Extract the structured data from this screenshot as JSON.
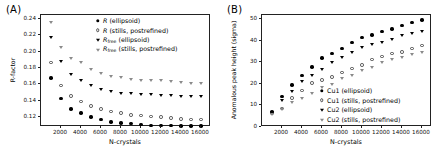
{
  "figure": {
    "panels": [
      {
        "label": "(A)",
        "axes": {
          "xlabel": "N-crystals",
          "ylabel": "R-factor",
          "xticks": [
            2000,
            4000,
            6000,
            8000,
            10000,
            12000,
            14000,
            16000
          ],
          "xticklabels": [
            "2000",
            "4000",
            "6000",
            "8000",
            "10000",
            "12000",
            "14000",
            "16000"
          ],
          "yticks": [
            0.12,
            0.14,
            0.16,
            0.18,
            0.2,
            0.22,
            0.24
          ],
          "yticklabels": [
            "0.12",
            "0.14",
            "0.16",
            "0.18",
            "0.20",
            "0.22",
            "0.24"
          ],
          "xlim": [
            0,
            17000
          ],
          "ylim": [
            0.108,
            0.245
          ]
        },
        "legend": [
          {
            "marker": "filled-circle",
            "label": "R (ellipsoid)"
          },
          {
            "marker": "open-circle",
            "label": "R (stills, postrefined)"
          },
          {
            "marker": "filled-triangle",
            "label": "Rfree (ellipsoid)"
          },
          {
            "marker": "open-triangle",
            "label": "Rfree (stills, postrefined)"
          }
        ]
      },
      {
        "label": "(B)",
        "axes": {
          "xlabel": "N-crystals",
          "ylabel": "Anomalous peak height (sigma)",
          "xticks": [
            2000,
            4000,
            6000,
            8000,
            10000,
            12000,
            14000,
            16000
          ],
          "xticklabels": [
            "2000",
            "4000",
            "6000",
            "8000",
            "10000",
            "12000",
            "14000",
            "16000"
          ],
          "yticks": [
            0,
            10,
            20,
            30,
            40,
            50
          ],
          "yticklabels": [
            "0",
            "10",
            "20",
            "30",
            "40",
            "50"
          ],
          "xlim": [
            0,
            17000
          ],
          "ylim": [
            0,
            52
          ]
        },
        "legend": [
          {
            "marker": "filled-circle",
            "label": "Cu1 (ellipsoid)"
          },
          {
            "marker": "open-circle",
            "label": "Cu1 (stills, postrefined)"
          },
          {
            "marker": "filled-triangle",
            "label": "Cu2 (ellipsoid)"
          },
          {
            "marker": "open-triangle",
            "label": "Cu2 (stills, postrefined)"
          }
        ]
      }
    ]
  },
  "chart_data": [
    {
      "type": "scatter",
      "panel": "(A)",
      "title": "",
      "xlabel": "N-crystals",
      "ylabel": "R-factor",
      "xlim": [
        0,
        17000
      ],
      "ylim": [
        0.108,
        0.245
      ],
      "grid": false,
      "legend_position": "upper right",
      "x": [
        1000,
        2000,
        3000,
        4000,
        5000,
        6000,
        7000,
        8000,
        9000,
        10000,
        11000,
        12000,
        13000,
        14000,
        15000,
        16000
      ],
      "series": [
        {
          "name": "R (ellipsoid)",
          "marker": "filled-circle",
          "values": [
            0.168,
            0.143,
            0.13,
            0.125,
            0.12,
            0.117,
            0.114,
            0.113,
            0.112,
            0.111,
            0.11,
            0.11,
            0.11,
            0.109,
            0.109,
            0.109
          ]
        },
        {
          "name": "R (stills, postrefined)",
          "marker": "open-circle",
          "values": [
            0.187,
            0.159,
            0.146,
            0.139,
            0.134,
            0.13,
            0.127,
            0.125,
            0.123,
            0.122,
            0.121,
            0.12,
            0.119,
            0.118,
            0.117,
            0.117
          ]
        },
        {
          "name": "Rfree (ellipsoid)",
          "marker": "filled-triangle",
          "values": [
            0.217,
            0.188,
            0.172,
            0.165,
            0.158,
            0.154,
            0.151,
            0.149,
            0.148,
            0.147,
            0.147,
            0.146,
            0.146,
            0.145,
            0.145,
            0.145
          ]
        },
        {
          "name": "Rfree (stills, postrefined)",
          "marker": "open-triangle",
          "values": [
            0.236,
            0.205,
            0.191,
            0.186,
            0.178,
            0.173,
            0.17,
            0.168,
            0.166,
            0.165,
            0.164,
            0.164,
            0.163,
            0.162,
            0.161,
            0.161
          ]
        }
      ]
    },
    {
      "type": "scatter",
      "panel": "(B)",
      "title": "",
      "xlabel": "N-crystals",
      "ylabel": "Anomalous peak height (sigma)",
      "xlim": [
        0,
        17000
      ],
      "ylim": [
        0,
        52
      ],
      "grid": false,
      "legend_position": "lower right",
      "x": [
        1000,
        2000,
        3000,
        4000,
        5000,
        6000,
        7000,
        8000,
        9000,
        10000,
        11000,
        12000,
        13000,
        14000,
        15000,
        16000
      ],
      "series": [
        {
          "name": "Cu1 (ellipsoid)",
          "marker": "filled-circle",
          "values": [
            7.0,
            14.3,
            19.5,
            23.9,
            27.8,
            32.0,
            34.1,
            36.4,
            39.3,
            41.6,
            42.7,
            44.2,
            45.5,
            47.2,
            48.5,
            49.6
          ]
        },
        {
          "name": "Cu1 (stills, postrefined)",
          "marker": "open-circle",
          "values": [
            6.3,
            8.6,
            13.6,
            17.0,
            20.4,
            21.8,
            23.3,
            25.3,
            27.2,
            28.9,
            31.3,
            32.8,
            34.1,
            34.8,
            36.5,
            37.9
          ]
        },
        {
          "name": "Cu2 (ellipsoid)",
          "marker": "filled-triangle",
          "values": [
            6.6,
            12.1,
            16.2,
            21.0,
            23.6,
            26.6,
            29.7,
            31.9,
            34.5,
            36.8,
            38.2,
            39.3,
            40.4,
            42.3,
            43.5,
            44.2
          ]
        },
        {
          "name": "Cu2 (stills, postrefined)",
          "marker": "open-triangle",
          "values": [
            5.7,
            8.0,
            11.2,
            13.3,
            15.6,
            18.2,
            19.8,
            22.3,
            23.9,
            26.0,
            27.5,
            29.6,
            31.2,
            32.3,
            33.6,
            34.6
          ]
        }
      ]
    }
  ]
}
